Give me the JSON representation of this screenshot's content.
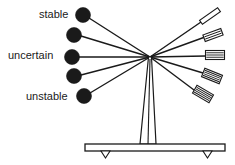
{
  "figure": {
    "kind": "mechanical-balance-diagram",
    "background_color": "#ffffff",
    "stroke_color": "#1a1a1a",
    "fill_color": "#1a1a1a",
    "width": 235,
    "height": 165
  },
  "labels": {
    "stable": "stable",
    "uncertain": "uncertain",
    "unstable": "unstable"
  },
  "hub": {
    "x": 150,
    "y": 57
  },
  "arms": [
    {
      "name": "arm-stable",
      "state": "stable",
      "weight": {
        "cx": 83,
        "cy": 15,
        "r": 7.5
      },
      "paddle": {
        "cx": 210,
        "cy": 16,
        "angle": -35,
        "w": 22,
        "h": 5,
        "hatch": 0
      },
      "left_end": {
        "x": 89,
        "y": 18
      },
      "right_end": {
        "x": 201,
        "y": 22
      }
    },
    {
      "name": "arm-upper-mid",
      "state": "stable-uncertain",
      "weight": {
        "cx": 74,
        "cy": 35,
        "r": 7.5
      },
      "paddle": {
        "cx": 213,
        "cy": 35,
        "angle": -20,
        "w": 19,
        "h": 7,
        "hatch": 2
      },
      "left_end": {
        "x": 81,
        "y": 36
      },
      "right_end": {
        "x": 205,
        "y": 37
      }
    },
    {
      "name": "arm-uncertain",
      "state": "uncertain",
      "weight": {
        "cx": 72,
        "cy": 57,
        "r": 7.5
      },
      "paddle": {
        "cx": 215,
        "cy": 55,
        "angle": 0,
        "w": 19,
        "h": 9,
        "hatch": 3
      },
      "left_end": {
        "x": 79,
        "y": 57
      },
      "right_end": {
        "x": 206,
        "y": 56
      }
    },
    {
      "name": "arm-lower-mid",
      "state": "uncertain-unstable",
      "weight": {
        "cx": 74,
        "cy": 76,
        "r": 7.5
      },
      "paddle": {
        "cx": 212,
        "cy": 76,
        "angle": 22,
        "w": 19,
        "h": 9,
        "hatch": 4
      },
      "left_end": {
        "x": 81,
        "y": 75
      },
      "right_end": {
        "x": 203,
        "y": 73
      }
    },
    {
      "name": "arm-unstable",
      "state": "unstable",
      "weight": {
        "cx": 84,
        "cy": 96,
        "r": 7.5
      },
      "paddle": {
        "cx": 203,
        "cy": 94,
        "angle": 30,
        "w": 19,
        "h": 9,
        "hatch": 4
      },
      "left_end": {
        "x": 90,
        "y": 93
      },
      "right_end": {
        "x": 194,
        "y": 90
      }
    }
  ],
  "mast": {
    "name": "support-mast",
    "top_x": 150,
    "top_y": 57,
    "bottom_left_x": 140,
    "bottom_right_x": 156,
    "bottom_y": 144
  },
  "base": {
    "name": "base-plate",
    "x": 85,
    "y": 144,
    "width": 140,
    "height": 7,
    "feet": [
      {
        "name": "foot-left",
        "x": 101,
        "y": 151,
        "w": 9,
        "h": 7
      },
      {
        "name": "foot-right",
        "x": 203,
        "y": 151,
        "w": 9,
        "h": 7
      }
    ]
  }
}
